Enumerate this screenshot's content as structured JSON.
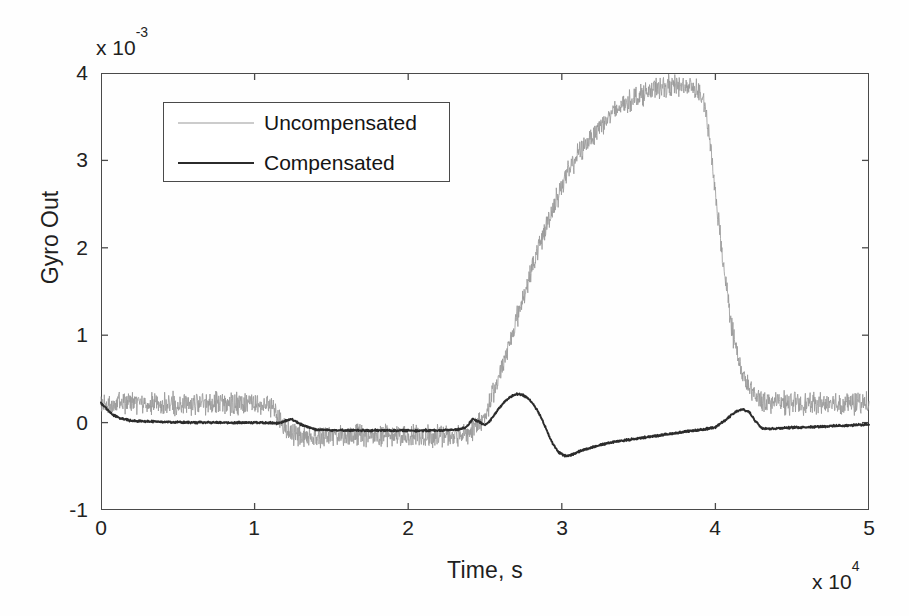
{
  "chart_data": {
    "type": "line",
    "title": "",
    "xlabel": "Time, s",
    "ylabel": "Gyro Out",
    "x_exponent_prefix": "x 10",
    "x_exponent": "4",
    "y_exponent_prefix": "x 10",
    "y_exponent": "-3",
    "xlim": [
      0,
      5
    ],
    "ylim": [
      -1,
      4
    ],
    "xticks": [
      "0",
      "1",
      "2",
      "3",
      "4",
      "5"
    ],
    "yticks": [
      "4",
      "3",
      "2",
      "1",
      "0",
      "-1"
    ],
    "xtick_values": [
      0,
      1,
      2,
      3,
      4,
      5
    ],
    "ytick_values": [
      4,
      3,
      2,
      1,
      0,
      -1
    ],
    "grid": false,
    "ticks_inward_all_sides": true,
    "legend_position": "upper-left-inside",
    "colors": {
      "uncompensated": "#9a9a9a",
      "compensated": "#2b2b2b",
      "axes": "#4a4a4a",
      "background": "#ffffff"
    },
    "series": [
      {
        "name": "Uncompensated",
        "style": "thin-noisy",
        "noise_amplitude": 0.13,
        "x": [
          0.0,
          0.1,
          0.25,
          0.4,
          0.55,
          0.7,
          0.85,
          1.0,
          1.08,
          1.14,
          1.18,
          1.22,
          1.26,
          1.32,
          1.4,
          1.55,
          1.7,
          1.85,
          2.0,
          2.15,
          2.25,
          2.32,
          2.38,
          2.44,
          2.5,
          2.56,
          2.62,
          2.7,
          2.78,
          2.86,
          2.94,
          3.02,
          3.1,
          3.18,
          3.26,
          3.34,
          3.42,
          3.5,
          3.58,
          3.66,
          3.74,
          3.82,
          3.88,
          3.92,
          3.96,
          4.0,
          4.06,
          4.12,
          4.18,
          4.24,
          4.3,
          4.4,
          4.55,
          4.7,
          4.85,
          5.0
        ],
        "y": [
          0.22,
          0.22,
          0.21,
          0.22,
          0.21,
          0.22,
          0.21,
          0.21,
          0.2,
          0.12,
          -0.02,
          -0.1,
          -0.14,
          -0.15,
          -0.15,
          -0.15,
          -0.15,
          -0.15,
          -0.15,
          -0.15,
          -0.15,
          -0.14,
          -0.12,
          -0.06,
          0.08,
          0.35,
          0.7,
          1.15,
          1.62,
          2.05,
          2.45,
          2.8,
          3.05,
          3.25,
          3.42,
          3.55,
          3.66,
          3.74,
          3.8,
          3.84,
          3.86,
          3.85,
          3.82,
          3.7,
          3.3,
          2.6,
          1.7,
          0.95,
          0.52,
          0.33,
          0.26,
          0.23,
          0.22,
          0.22,
          0.22,
          0.22
        ]
      },
      {
        "name": "Compensated",
        "style": "thick-smooth",
        "noise_amplitude": 0.012,
        "x": [
          0.0,
          0.03,
          0.07,
          0.12,
          0.2,
          0.4,
          0.6,
          0.8,
          1.0,
          1.1,
          1.16,
          1.2,
          1.24,
          1.3,
          1.4,
          1.6,
          1.8,
          2.0,
          2.2,
          2.32,
          2.38,
          2.42,
          2.46,
          2.5,
          2.52,
          2.55,
          2.58,
          2.62,
          2.66,
          2.7,
          2.74,
          2.78,
          2.82,
          2.86,
          2.9,
          2.94,
          2.98,
          3.02,
          3.06,
          3.1,
          3.16,
          3.24,
          3.34,
          3.46,
          3.58,
          3.7,
          3.82,
          3.92,
          4.0,
          4.06,
          4.1,
          4.14,
          4.18,
          4.22,
          4.26,
          4.3,
          4.36,
          4.45,
          4.6,
          4.75,
          4.9,
          5.0
        ],
        "y": [
          0.22,
          0.17,
          0.1,
          0.05,
          0.02,
          0.01,
          0.0,
          0.0,
          0.0,
          0.0,
          -0.01,
          0.02,
          0.04,
          -0.02,
          -0.08,
          -0.09,
          -0.09,
          -0.09,
          -0.09,
          -0.08,
          -0.05,
          0.04,
          0.01,
          -0.03,
          0.0,
          0.06,
          0.14,
          0.22,
          0.29,
          0.33,
          0.32,
          0.28,
          0.2,
          0.08,
          -0.08,
          -0.24,
          -0.34,
          -0.38,
          -0.37,
          -0.34,
          -0.3,
          -0.26,
          -0.22,
          -0.19,
          -0.16,
          -0.13,
          -0.1,
          -0.08,
          -0.05,
          0.02,
          0.08,
          0.13,
          0.15,
          0.12,
          0.02,
          -0.06,
          -0.07,
          -0.06,
          -0.05,
          -0.04,
          -0.03,
          -0.02
        ]
      }
    ]
  },
  "legend": {
    "items": [
      {
        "label": "Uncompensated"
      },
      {
        "label": "Compensated"
      }
    ]
  }
}
